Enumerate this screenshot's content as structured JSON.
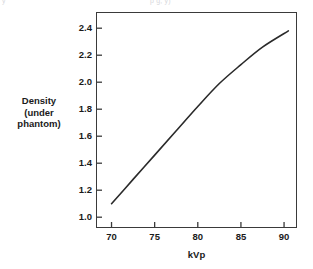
{
  "figure": {
    "top_artifact_left": "y",
    "top_artifact_right": "p        g,          y)",
    "frame_color": "#3a3a3a",
    "curve_color": "#2a2a2a",
    "background": "#ffffff"
  },
  "chart_data": {
    "type": "line",
    "title": "",
    "xlabel": "kVp",
    "ylabel": "Density (under phantom)",
    "ylabel_lines": [
      "Density",
      "(under",
      "phantom)"
    ],
    "xlim": [
      68.2,
      91.5
    ],
    "ylim": [
      0.92,
      2.52
    ],
    "xticks": [
      70,
      75,
      80,
      85,
      90
    ],
    "xtick_labels": [
      "70",
      "75",
      "80",
      "85",
      "90"
    ],
    "yticks": [
      1.0,
      1.2,
      1.4,
      1.6,
      1.8,
      2.0,
      2.2,
      2.4
    ],
    "ytick_labels": [
      "1.0",
      "1.2",
      "1.4",
      "1.6",
      "1.8",
      "2.0",
      "2.2",
      "2.4"
    ],
    "grid": false,
    "legend": null,
    "series": [
      {
        "name": "Density under phantom vs kVp",
        "x": [
          70.0,
          72.5,
          75.0,
          77.5,
          80.0,
          82.5,
          85.0,
          87.5,
          90.5
        ],
        "values": [
          1.1,
          1.28,
          1.46,
          1.64,
          1.82,
          1.99,
          2.13,
          2.26,
          2.38
        ]
      }
    ]
  }
}
